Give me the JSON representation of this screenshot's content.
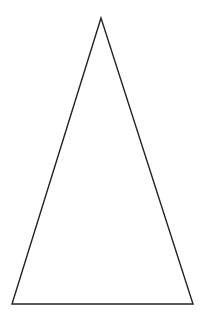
{
  "figure": {
    "shape": "isosceles-triangle",
    "stroke_color": "#222222",
    "fill_color": "#ffffff",
    "background": "#ffffff",
    "vertices": {
      "apex": [
        101,
        18
      ],
      "bottom_left": [
        12,
        304
      ],
      "bottom_right": [
        193,
        304
      ]
    }
  }
}
